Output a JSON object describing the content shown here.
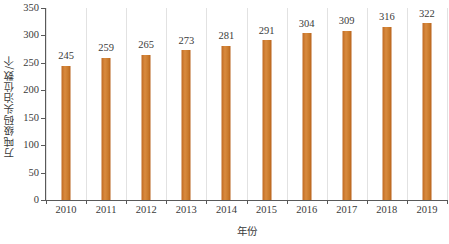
{
  "chart_data": {
    "type": "bar",
    "title": "",
    "xlabel": "年份",
    "ylabel": "万吨级码头泊位数/个",
    "categories": [
      "2010",
      "2011",
      "2012",
      "2013",
      "2014",
      "2015",
      "2016",
      "2017",
      "2018",
      "2019"
    ],
    "values": [
      245,
      259,
      265,
      273,
      281,
      291,
      304,
      309,
      316,
      322
    ],
    "series": [
      {
        "name": "万吨级码头泊位数",
        "values": [
          245,
          259,
          265,
          273,
          281,
          291,
          304,
          309,
          316,
          322
        ]
      }
    ],
    "ylim": [
      0,
      350
    ],
    "ytick_labels": [
      "0",
      "50",
      "100",
      "150",
      "200",
      "250",
      "300",
      "350"
    ],
    "ytick_values": [
      0,
      50,
      100,
      150,
      200,
      250,
      300,
      350
    ],
    "grid": "vertical-only",
    "legend": "none",
    "bar_color": "#c97a2c",
    "gridline_color": "#e2e2e2",
    "axis_color": "#595959",
    "background_color": "#ffffff",
    "data_labels": [
      "245",
      "259",
      "265",
      "273",
      "281",
      "291",
      "304",
      "309",
      "316",
      "322"
    ]
  }
}
